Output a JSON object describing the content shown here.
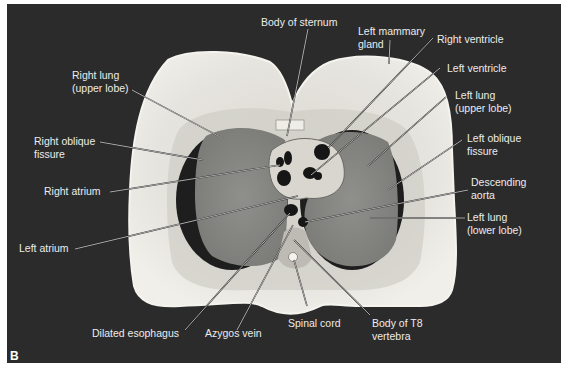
{
  "figure": {
    "panel_letter": "B",
    "colors": {
      "background": "#2b2b2b",
      "page": "#ffffff",
      "tissue_light": "#e2e0da",
      "lung": "#8a8a86",
      "lung_rim": "#1e1e1e",
      "label_text": "#ececec"
    }
  },
  "labels": {
    "body_of_sternum": {
      "lines": [
        "Body of sternum"
      ]
    },
    "left_mammary_gland": {
      "lines": [
        "Left mammary",
        "gland"
      ]
    },
    "right_ventricle": {
      "lines": [
        "Right ventricle"
      ]
    },
    "left_ventricle": {
      "lines": [
        "Left ventricle"
      ]
    },
    "left_lung_upper": {
      "lines": [
        "Left lung",
        "(upper lobe)"
      ]
    },
    "left_oblique_fissure": {
      "lines": [
        "Left oblique",
        "fissure"
      ]
    },
    "descending_aorta": {
      "lines": [
        "Descending",
        "aorta"
      ]
    },
    "left_lung_lower": {
      "lines": [
        "Left lung",
        "(lower lobe)"
      ]
    },
    "right_lung_upper": {
      "lines": [
        "Right lung",
        "(upper lobe)"
      ]
    },
    "right_oblique_fissure": {
      "lines": [
        "Right oblique",
        "fissure"
      ]
    },
    "right_atrium": {
      "lines": [
        "Right atrium"
      ]
    },
    "left_atrium": {
      "lines": [
        "Left atrium"
      ]
    },
    "dilated_esophagus": {
      "lines": [
        "Dilated esophagus"
      ]
    },
    "azygos_vein": {
      "lines": [
        "Azygos vein"
      ]
    },
    "spinal_cord": {
      "lines": [
        "Spinal cord"
      ]
    },
    "body_of_t8_vertebra": {
      "lines": [
        "Body of T8",
        "vertebra"
      ]
    }
  }
}
